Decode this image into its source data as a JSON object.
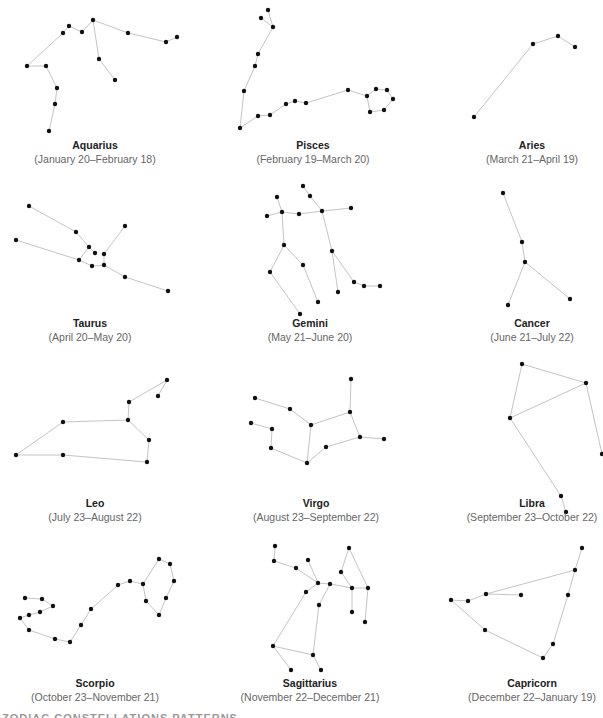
{
  "chart_data": {
    "type": "diagram",
    "title": "Zodiac constellations",
    "constellations": [
      {
        "name": "Aquarius",
        "dates": "(January 20–February 18)",
        "label_x": 95,
        "label_y": 149,
        "stars": [
          [
            27,
            66
          ],
          [
            46,
            66
          ],
          [
            57,
            88
          ],
          [
            55,
            104
          ],
          [
            49,
            131
          ],
          [
            63,
            33
          ],
          [
            69,
            26
          ],
          [
            82,
            32
          ],
          [
            93,
            20
          ],
          [
            99,
            59
          ],
          [
            115,
            80
          ],
          [
            128,
            33
          ],
          [
            166,
            42
          ],
          [
            177,
            37
          ]
        ],
        "edges": [
          [
            0,
            1
          ],
          [
            1,
            2
          ],
          [
            2,
            3
          ],
          [
            3,
            4
          ],
          [
            0,
            5
          ],
          [
            5,
            6
          ],
          [
            6,
            7
          ],
          [
            7,
            8
          ],
          [
            8,
            9
          ],
          [
            9,
            10
          ],
          [
            8,
            11
          ],
          [
            11,
            12
          ],
          [
            12,
            13
          ]
        ]
      },
      {
        "name": "Pisces",
        "dates": "(February 19–March 20)",
        "label_x": 313,
        "label_y": 149,
        "stars": [
          [
            268,
            10
          ],
          [
            261,
            18
          ],
          [
            273,
            27
          ],
          [
            258,
            54
          ],
          [
            255,
            66
          ],
          [
            244,
            91
          ],
          [
            240,
            128
          ],
          [
            258,
            116
          ],
          [
            270,
            115
          ],
          [
            286,
            104
          ],
          [
            295,
            101
          ],
          [
            306,
            103
          ],
          [
            348,
            90
          ],
          [
            367,
            96
          ],
          [
            376,
            89
          ],
          [
            387,
            90
          ],
          [
            393,
            99
          ],
          [
            384,
            110
          ],
          [
            370,
            112
          ]
        ],
        "edges": [
          [
            0,
            2
          ],
          [
            1,
            2
          ],
          [
            2,
            3
          ],
          [
            3,
            4
          ],
          [
            4,
            5
          ],
          [
            5,
            6
          ],
          [
            6,
            7
          ],
          [
            7,
            8
          ],
          [
            8,
            9
          ],
          [
            9,
            10
          ],
          [
            10,
            11
          ],
          [
            11,
            12
          ],
          [
            12,
            13
          ],
          [
            13,
            14
          ],
          [
            14,
            15
          ],
          [
            15,
            16
          ],
          [
            16,
            17
          ],
          [
            17,
            18
          ],
          [
            18,
            13
          ]
        ]
      },
      {
        "name": "Aries",
        "dates": "(March 21–April 19)",
        "label_x": 532,
        "label_y": 149,
        "stars": [
          [
            474,
            117
          ],
          [
            533,
            44
          ],
          [
            558,
            36
          ],
          [
            575,
            47
          ]
        ],
        "edges": [
          [
            0,
            1
          ],
          [
            1,
            2
          ],
          [
            2,
            3
          ]
        ]
      },
      {
        "name": "Taurus",
        "dates": "(April 20–May 20)",
        "label_x": 90,
        "label_y": 327,
        "stars": [
          [
            29,
            206
          ],
          [
            76,
            232
          ],
          [
            89,
            247
          ],
          [
            95,
            253
          ],
          [
            104,
            254
          ],
          [
            125,
            226
          ],
          [
            16,
            240
          ],
          [
            79,
            260
          ],
          [
            92,
            266
          ],
          [
            104,
            265
          ],
          [
            125,
            277
          ],
          [
            168,
            291
          ]
        ],
        "edges": [
          [
            0,
            1
          ],
          [
            1,
            2
          ],
          [
            2,
            3
          ],
          [
            2,
            7
          ],
          [
            4,
            5
          ],
          [
            4,
            9
          ],
          [
            6,
            7
          ],
          [
            7,
            8
          ],
          [
            8,
            9
          ],
          [
            9,
            10
          ],
          [
            10,
            11
          ]
        ]
      },
      {
        "name": "Gemini",
        "dates": "(May 21–June 20)",
        "label_x": 310,
        "label_y": 327,
        "stars": [
          [
            303,
            186
          ],
          [
            310,
            196
          ],
          [
            322,
            211
          ],
          [
            351,
            208
          ],
          [
            277,
            197
          ],
          [
            267,
            216
          ],
          [
            282,
            212
          ],
          [
            299,
            214
          ],
          [
            284,
            245
          ],
          [
            270,
            272
          ],
          [
            300,
            314
          ],
          [
            303,
            265
          ],
          [
            318,
            302
          ],
          [
            332,
            251
          ],
          [
            338,
            292
          ],
          [
            354,
            282
          ],
          [
            364,
            286
          ],
          [
            380,
            286
          ]
        ],
        "edges": [
          [
            0,
            1
          ],
          [
            1,
            2
          ],
          [
            2,
            3
          ],
          [
            4,
            6
          ],
          [
            5,
            6
          ],
          [
            6,
            7
          ],
          [
            7,
            2
          ],
          [
            6,
            8
          ],
          [
            8,
            9
          ],
          [
            9,
            10
          ],
          [
            8,
            11
          ],
          [
            11,
            12
          ],
          [
            2,
            13
          ],
          [
            13,
            14
          ],
          [
            13,
            15
          ],
          [
            15,
            16
          ],
          [
            16,
            17
          ]
        ]
      },
      {
        "name": "Cancer",
        "dates": "(June 21–July 22)",
        "label_x": 532,
        "label_y": 327,
        "stars": [
          [
            503,
            193
          ],
          [
            522,
            242
          ],
          [
            525,
            262
          ],
          [
            508,
            305
          ],
          [
            570,
            299
          ]
        ],
        "edges": [
          [
            0,
            1
          ],
          [
            1,
            2
          ],
          [
            2,
            3
          ],
          [
            2,
            4
          ]
        ]
      },
      {
        "name": "Leo",
        "dates": "(July 23–August 22)",
        "label_x": 95,
        "label_y": 507,
        "stars": [
          [
            167,
            380
          ],
          [
            158,
            396
          ],
          [
            129,
            402
          ],
          [
            128,
            420
          ],
          [
            63,
            422
          ],
          [
            16,
            455
          ],
          [
            63,
            455
          ],
          [
            147,
            462
          ],
          [
            149,
            440
          ]
        ],
        "edges": [
          [
            0,
            1
          ],
          [
            0,
            2
          ],
          [
            2,
            3
          ],
          [
            3,
            4
          ],
          [
            4,
            5
          ],
          [
            5,
            6
          ],
          [
            6,
            7
          ],
          [
            7,
            8
          ],
          [
            8,
            3
          ]
        ]
      },
      {
        "name": "Virgo",
        "dates": "(August 23–September 22)",
        "label_x": 316,
        "label_y": 507,
        "stars": [
          [
            255,
            398
          ],
          [
            290,
            409
          ],
          [
            311,
            425
          ],
          [
            350,
            412
          ],
          [
            351,
            379
          ],
          [
            360,
            437
          ],
          [
            384,
            439
          ],
          [
            326,
            447
          ],
          [
            307,
            463
          ],
          [
            271,
            448
          ],
          [
            272,
            429
          ],
          [
            251,
            423
          ]
        ],
        "edges": [
          [
            0,
            1
          ],
          [
            1,
            2
          ],
          [
            2,
            3
          ],
          [
            3,
            4
          ],
          [
            3,
            5
          ],
          [
            5,
            6
          ],
          [
            5,
            7
          ],
          [
            7,
            8
          ],
          [
            2,
            8
          ],
          [
            8,
            9
          ],
          [
            9,
            10
          ],
          [
            10,
            11
          ]
        ]
      },
      {
        "name": "Libra",
        "dates": "(September 23–October 22)",
        "label_x": 532,
        "label_y": 507,
        "stars": [
          [
            522,
            364
          ],
          [
            586,
            383
          ],
          [
            510,
            418
          ],
          [
            561,
            496
          ],
          [
            566,
            512
          ],
          [
            602,
            454
          ]
        ],
        "edges": [
          [
            0,
            1
          ],
          [
            1,
            2
          ],
          [
            2,
            0
          ],
          [
            2,
            3
          ],
          [
            3,
            4
          ],
          [
            1,
            5
          ]
        ]
      },
      {
        "name": "Scorpio",
        "dates": "(October 23–November 21)",
        "label_x": 95,
        "label_y": 687,
        "stars": [
          [
            25,
            598
          ],
          [
            42,
            599
          ],
          [
            53,
            606
          ],
          [
            40,
            612
          ],
          [
            29,
            615
          ],
          [
            20,
            618
          ],
          [
            29,
            630
          ],
          [
            55,
            639
          ],
          [
            70,
            642
          ],
          [
            81,
            625
          ],
          [
            91,
            609
          ],
          [
            118,
            585
          ],
          [
            130,
            581
          ],
          [
            143,
            584
          ],
          [
            159,
            559
          ],
          [
            170,
            564
          ],
          [
            174,
            581
          ],
          [
            166,
            598
          ],
          [
            159,
            615
          ],
          [
            146,
            601
          ]
        ],
        "edges": [
          [
            0,
            1
          ],
          [
            1,
            2
          ],
          [
            2,
            3
          ],
          [
            3,
            4
          ],
          [
            4,
            5
          ],
          [
            5,
            6
          ],
          [
            6,
            7
          ],
          [
            7,
            8
          ],
          [
            8,
            9
          ],
          [
            9,
            10
          ],
          [
            10,
            11
          ],
          [
            11,
            12
          ],
          [
            12,
            13
          ],
          [
            13,
            14
          ],
          [
            14,
            15
          ],
          [
            15,
            16
          ],
          [
            16,
            17
          ],
          [
            17,
            18
          ],
          [
            18,
            19
          ],
          [
            19,
            13
          ]
        ]
      },
      {
        "name": "Sagittarius",
        "dates": "(November 22–December 21)",
        "label_x": 310,
        "label_y": 687,
        "stars": [
          [
            275,
            546
          ],
          [
            274,
            561
          ],
          [
            296,
            568
          ],
          [
            308,
            560
          ],
          [
            318,
            583
          ],
          [
            330,
            584
          ],
          [
            306,
            592
          ],
          [
            319,
            605
          ],
          [
            349,
            548
          ],
          [
            341,
            572
          ],
          [
            352,
            588
          ],
          [
            368,
            588
          ],
          [
            352,
            612
          ],
          [
            365,
            622
          ],
          [
            273,
            646
          ],
          [
            313,
            655
          ],
          [
            291,
            670
          ],
          [
            321,
            670
          ]
        ],
        "edges": [
          [
            0,
            1
          ],
          [
            1,
            2
          ],
          [
            2,
            4
          ],
          [
            3,
            4
          ],
          [
            4,
            5
          ],
          [
            5,
            10
          ],
          [
            4,
            6
          ],
          [
            6,
            14
          ],
          [
            5,
            7
          ],
          [
            7,
            15
          ],
          [
            14,
            15
          ],
          [
            14,
            16
          ],
          [
            15,
            17
          ],
          [
            8,
            9
          ],
          [
            9,
            10
          ],
          [
            8,
            11
          ],
          [
            10,
            11
          ],
          [
            10,
            12
          ],
          [
            11,
            13
          ]
        ]
      },
      {
        "name": "Capricorn",
        "dates": "(December 22–January 19)",
        "label_x": 532,
        "label_y": 687,
        "stars": [
          [
            582,
            548
          ],
          [
            575,
            570
          ],
          [
            568,
            595
          ],
          [
            521,
            595
          ],
          [
            486,
            594
          ],
          [
            468,
            601
          ],
          [
            451,
            600
          ],
          [
            485,
            630
          ],
          [
            543,
            658
          ],
          [
            553,
            644
          ]
        ],
        "edges": [
          [
            0,
            1
          ],
          [
            1,
            4
          ],
          [
            4,
            3
          ],
          [
            4,
            5
          ],
          [
            5,
            6
          ],
          [
            6,
            7
          ],
          [
            7,
            8
          ],
          [
            8,
            9
          ],
          [
            9,
            2
          ],
          [
            2,
            1
          ]
        ]
      }
    ]
  },
  "footer_cut_text": "ZODIAC CONSTELLATIONS PATTERNS"
}
